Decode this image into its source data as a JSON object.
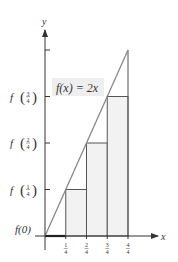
{
  "chart_data": {
    "type": "area",
    "title": "",
    "function_label": "f(x) = 2x",
    "xlabel": "x",
    "ylabel": "y",
    "xlim": [
      0,
      1.15
    ],
    "ylim": [
      0,
      2.3
    ],
    "function": {
      "expression": "2x",
      "x": [
        0,
        1
      ],
      "y": [
        0,
        2
      ]
    },
    "x_ticks": [
      {
        "value": 0.25,
        "num": "1",
        "den": "4"
      },
      {
        "value": 0.5,
        "num": "2",
        "den": "4"
      },
      {
        "value": 0.75,
        "num": "3",
        "den": "4"
      },
      {
        "value": 1.0,
        "num": "4",
        "den": "4"
      }
    ],
    "y_ticks": [
      {
        "value": 0,
        "label": "f(0)"
      },
      {
        "value": 0.5,
        "label": "f",
        "num": "1",
        "den": "4"
      },
      {
        "value": 1.0,
        "label": "f",
        "num": "2",
        "den": "4"
      },
      {
        "value": 1.5,
        "label": "f",
        "num": "3",
        "den": "4"
      },
      {
        "value": 2.0,
        "label": ""
      }
    ],
    "rectangles": [
      {
        "x0": 0,
        "x1": 0.25,
        "height": 0
      },
      {
        "x0": 0.25,
        "x1": 0.5,
        "height": 0.5
      },
      {
        "x0": 0.5,
        "x1": 0.75,
        "height": 1.0
      },
      {
        "x0": 0.75,
        "x1": 1.0,
        "height": 1.5
      }
    ],
    "colors": {
      "axis": "#333333",
      "line": "#888888",
      "rect_fill": "#f2f2f2",
      "rect_stroke": "#555555",
      "label_bg": "#eeeeee"
    }
  }
}
